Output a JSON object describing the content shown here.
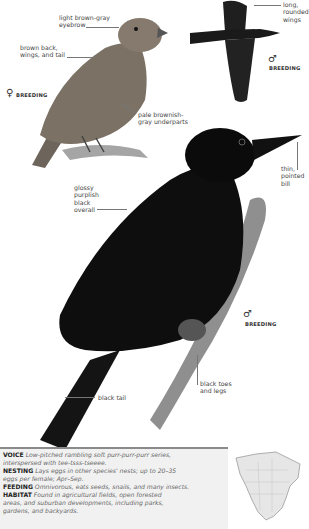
{
  "illustrations": {
    "female": {
      "sex_symbol": "♀",
      "tag": "BREEDING",
      "callouts": [
        "light brown-gray\neyebrow",
        "brown back,\nwings, and tail",
        "pale brownish-\ngray underparts"
      ],
      "colors": {
        "plumage": "#7a6f62",
        "branch": "#9a9a9a"
      }
    },
    "flight_male": {
      "sex_symbol": "♂",
      "tag": "BREEDING",
      "callouts": [
        "long,\nrounded\nwings"
      ],
      "colors": {
        "plumage": "#1b1b1b"
      }
    },
    "perched_male": {
      "sex_symbol": "♂",
      "tag": "BREEDING",
      "callouts": [
        "glossy\npurplish\nblack\noverall",
        "thin,\npointed\nbill",
        "black toes\nand legs",
        "black tail"
      ],
      "colors": {
        "plumage": "#0d0d0d",
        "branch": "#8d8d8d"
      }
    }
  },
  "info": {
    "voice": {
      "heading": "VOICE",
      "text_1": "Low-pitched rambling soft purr-purr-purr series,",
      "text_2": "interspersed with tee-tsss-tseeee."
    },
    "nesting": {
      "heading": "NESTING",
      "text_1": "Lays eggs in other species' nests; up to 20–35",
      "text_2": "eggs per female; Apr–Sep."
    },
    "feeding": {
      "heading": "FEEDING",
      "text_1": "Omnivorous, eats seeds, snails, and many insects."
    },
    "habitat": {
      "heading": "HABITAT",
      "text_1": "Found in agricultural fields, open forested",
      "text_2": "areas, and suburban developments, including parks,",
      "text_3": "gardens, and backyards."
    }
  },
  "range_map": {
    "region": "North America",
    "colors": {
      "land": "#e6e6e6",
      "outline": "#9a9a9a"
    }
  }
}
